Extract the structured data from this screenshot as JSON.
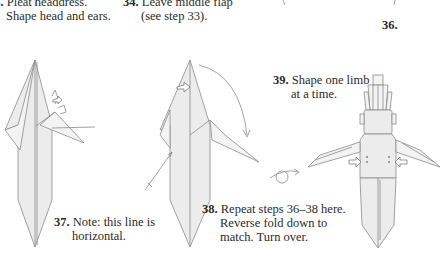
{
  "steps": [
    {
      "number": "33.",
      "line1": "Pleat headdress.",
      "line2": "Shape head and ears."
    },
    {
      "number": "34.",
      "line1": "Leave middle flap",
      "line2": "(see step 33)."
    },
    {
      "number": "36."
    },
    {
      "number": "37.",
      "line1": "Note: this line is",
      "line2": "horizontal."
    },
    {
      "number": "38.",
      "line1": "Repeat steps 36–38 here.",
      "line2": "Reverse fold down to",
      "line3": "match. Turn over."
    },
    {
      "number": "39.",
      "line1": "Shape one limb",
      "line2": "at a time."
    }
  ],
  "symbols": {
    "fold_arrow": "curved-arrow-icon",
    "push_arrow": "push-arrow-icon",
    "turn_over": "turn-over-icon"
  },
  "colors": {
    "paper": "#ececec",
    "lines": "#8a8a8a",
    "text": "#2a2a2a"
  }
}
